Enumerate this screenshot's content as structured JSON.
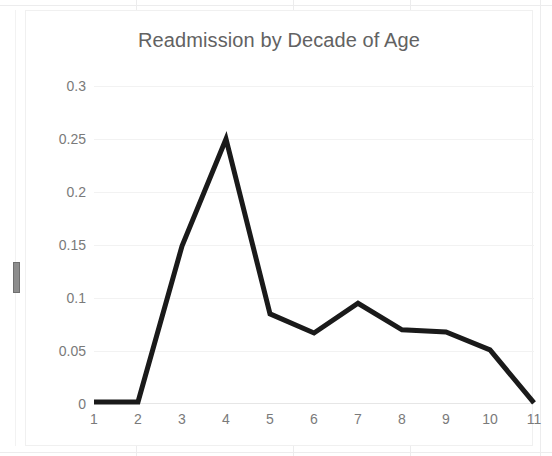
{
  "chart_data": {
    "type": "line",
    "title": "Readmission by Decade of Age",
    "xlabel": "",
    "ylabel": "",
    "categories": [
      "1",
      "2",
      "3",
      "4",
      "5",
      "6",
      "7",
      "8",
      "9",
      "10",
      "11"
    ],
    "x": [
      1,
      2,
      3,
      4,
      5,
      6,
      7,
      8,
      9,
      10,
      11
    ],
    "values": [
      0.002,
      0.002,
      0.149,
      0.25,
      0.085,
      0.067,
      0.095,
      0.07,
      0.068,
      0.051,
      0.001
    ],
    "series": [
      {
        "name": "Readmission rate",
        "values": [
          0.002,
          0.002,
          0.149,
          0.25,
          0.085,
          0.067,
          0.095,
          0.07,
          0.068,
          0.051,
          0.001
        ]
      }
    ],
    "ylim": [
      0,
      0.3
    ],
    "xlim": [
      1,
      11
    ],
    "ytick_labels": [
      "0",
      "0.05",
      "0.1",
      "0.15",
      "0.2",
      "0.25",
      "0.3"
    ],
    "ytick_values": [
      0,
      0.05,
      0.1,
      0.15,
      0.2,
      0.25,
      0.3
    ],
    "xtick_labels": [
      "1",
      "2",
      "3",
      "4",
      "5",
      "6",
      "7",
      "8",
      "9",
      "10",
      "11"
    ],
    "grid": "horizontal",
    "legend": "none",
    "line_color": "#1a1a1a",
    "line_width": 5,
    "title_color": "#626262",
    "tick_color": "#7a7a7a",
    "gridline_color": "#f2f2f2",
    "plot_background": "#ffffff"
  },
  "chart": {
    "title": "Readmission by Decade of Age"
  },
  "ylabels": {
    "t0": "0",
    "t1": "0.05",
    "t2": "0.1",
    "t3": "0.15",
    "t4": "0.2",
    "t5": "0.25",
    "t6": "0.3"
  },
  "xlabels": {
    "t1": "1",
    "t2": "2",
    "t3": "3",
    "t4": "4",
    "t5": "5",
    "t6": "6",
    "t7": "7",
    "t8": "8",
    "t9": "9",
    "t10": "10",
    "t11": "11"
  }
}
